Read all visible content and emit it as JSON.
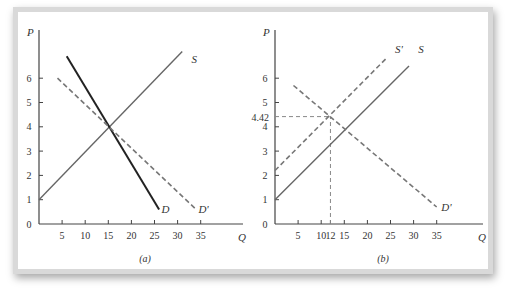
{
  "figure": {
    "panels": [
      {
        "id": "a",
        "label": "(a)"
      },
      {
        "id": "b",
        "label": "(b)"
      }
    ]
  },
  "chart_data": [
    {
      "type": "line",
      "panel_label": "(a)",
      "xlabel": "Q",
      "ylabel": "P",
      "x_ticks": [
        5,
        10,
        15,
        20,
        25,
        30,
        35
      ],
      "y_ticks": [
        0,
        1,
        2,
        3,
        4,
        5,
        6
      ],
      "xlim": [
        0,
        42
      ],
      "ylim": [
        0,
        7.5
      ],
      "grid": false,
      "series": [
        {
          "name": "S",
          "style": "solid",
          "color": "#666666",
          "points": [
            [
              0,
              1
            ],
            [
              31,
              7.1
            ]
          ]
        },
        {
          "name": "D",
          "style": "solid-bold",
          "color": "#222222",
          "points": [
            [
              6,
              6.9
            ],
            [
              26,
              0.6
            ]
          ]
        },
        {
          "name": "D'",
          "style": "dashed",
          "color": "#777777",
          "points": [
            [
              4,
              6.0
            ],
            [
              34,
              0.6
            ]
          ]
        }
      ],
      "annotations": [
        {
          "text": "S",
          "x": 33,
          "y": 6.8
        },
        {
          "text": "D",
          "x": 26.5,
          "y": 0.6
        },
        {
          "text": "D'",
          "x": 34.5,
          "y": 0.6
        }
      ]
    },
    {
      "type": "line",
      "panel_label": "(b)",
      "xlabel": "Q",
      "ylabel": "P",
      "x_ticks": [
        5,
        10,
        12,
        15,
        20,
        25,
        30,
        35
      ],
      "y_ticks": [
        0,
        1,
        2,
        3,
        4,
        5,
        6
      ],
      "xlim": [
        0,
        42
      ],
      "ylim": [
        0,
        7.5
      ],
      "grid": false,
      "series": [
        {
          "name": "S",
          "style": "solid",
          "color": "#666666",
          "points": [
            [
              0,
              1
            ],
            [
              29,
              6.5
            ]
          ]
        },
        {
          "name": "S'",
          "style": "dashed",
          "color": "#777777",
          "points": [
            [
              0,
              2.2
            ],
            [
              24,
              6.8
            ]
          ]
        },
        {
          "name": "D'",
          "style": "dashed",
          "color": "#777777",
          "points": [
            [
              4,
              5.7
            ],
            [
              35,
              0.7
            ]
          ]
        }
      ],
      "guides": [
        {
          "type": "hline",
          "y": 4.42,
          "x_from": 0,
          "x_to": 12,
          "style": "dashed"
        },
        {
          "type": "vline",
          "x": 12,
          "y_from": 0,
          "y_to": 4.42,
          "style": "dashed"
        }
      ],
      "annotations": [
        {
          "text": "S'",
          "x": 26,
          "y": 7.2
        },
        {
          "text": "S",
          "x": 31,
          "y": 7.2
        },
        {
          "text": "D'",
          "x": 36,
          "y": 0.7
        },
        {
          "text": "4.42",
          "x": -3,
          "y": 4.42
        }
      ]
    }
  ]
}
